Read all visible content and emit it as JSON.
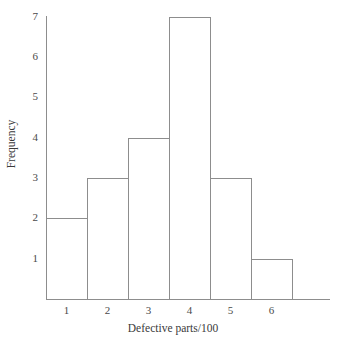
{
  "chart_data": {
    "type": "bar",
    "title": "",
    "subtitle": "",
    "xlabel": "Defective parts/100",
    "ylabel": "Frequency",
    "categories": [
      "1",
      "2",
      "3",
      "4",
      "5",
      "6"
    ],
    "values": [
      2,
      3,
      4,
      7,
      3,
      1
    ],
    "series": [
      {
        "name": "Frequency",
        "values": [
          2,
          3,
          4,
          7,
          3,
          1
        ]
      }
    ],
    "xtick_labels": [
      "1",
      "2",
      "3",
      "4",
      "5",
      "6"
    ],
    "ytick_labels": [
      "1",
      "2",
      "3",
      "4",
      "5",
      "6",
      "7"
    ],
    "ytick_values": [
      1,
      2,
      3,
      4,
      5,
      6,
      7
    ],
    "ylim": [
      0,
      7
    ],
    "xlim": [
      0.5,
      6.5
    ],
    "grid": false,
    "legend": false,
    "legend_position": "none",
    "annotations": [],
    "style": {
      "line_color": "#8d8d8d",
      "bar_fill": "none",
      "background": "#ffffff",
      "text_color": "#3a3a3a"
    }
  }
}
